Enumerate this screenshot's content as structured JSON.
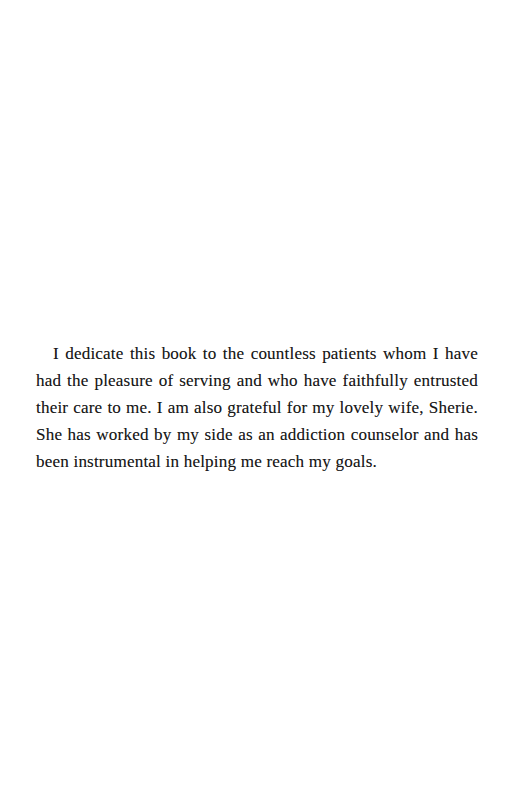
{
  "page": {
    "kind": "book-dedication-page",
    "background_color": "#ffffff",
    "ink_color": "#181818",
    "width": 514,
    "height": 808
  },
  "body": {
    "dedication_text": "I dedicate this book to the countless patients whom I have had the pleasure of serving and who have faithfully entrusted their care to me. I am also grateful for my lovely wife, Sherie. She has worked by my side as an addiction counselor and has been instrumental in helping me reach my goals.",
    "lines": [
      "I dedicate this book to the countless patients whom I have had",
      "the pleasure of serving and who have faithfully entrusted their care",
      "to me. I am also grateful for my lovely wife, Sherie. She has worked",
      "by my side as an addiction counselor and has been instrumental in",
      "helping me reach my goals."
    ]
  }
}
